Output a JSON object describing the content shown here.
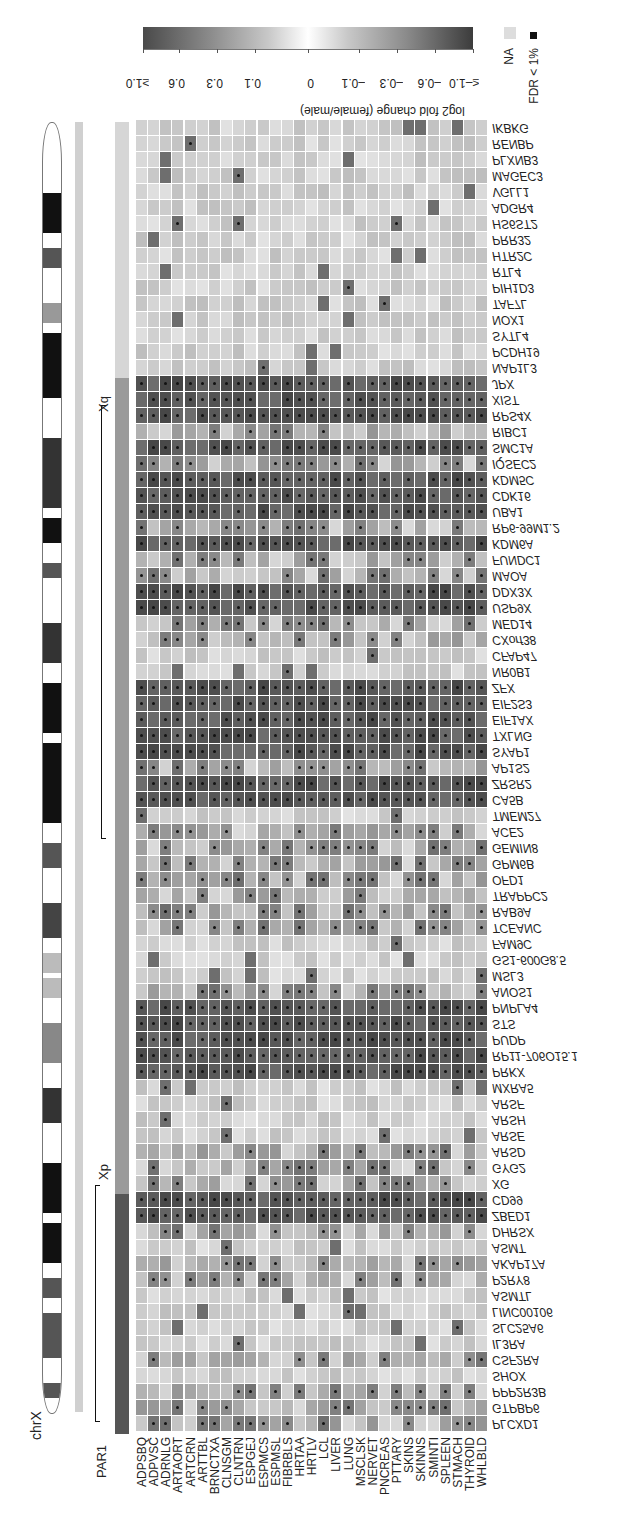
{
  "chart_data": {
    "type": "heatmap",
    "title": "",
    "colorbar": {
      "label": "log2 fold change (female/male)",
      "ticks": [
        "≥1.0",
        "0.6",
        "0.3",
        "0.1",
        "0",
        "–0.1",
        "–0.3",
        "–0.6",
        "≤–1.0"
      ]
    },
    "legend": {
      "na_label": "NA",
      "fdr_label": "FDR < 1%"
    },
    "chromosome_label": "chrX",
    "region_labels": {
      "xq": "Xq",
      "xp": "Xp",
      "par1": "PAR1"
    },
    "columns": [
      "ADPSBQ",
      "ADPVSC",
      "ADRNLG",
      "ARTAORT",
      "ARTCRN",
      "ARTTBL",
      "BRNCTXA",
      "CLNSGM",
      "CLNTRN",
      "ESPGEJ",
      "ESPMCS",
      "ESPMSL",
      "FIBRBLS",
      "HRTAA",
      "HRTLV",
      "LCL",
      "LIVER",
      "LUNG",
      "MSCLSK",
      "NERVET",
      "PNCREAS",
      "PTTARY",
      "SKINS",
      "SKINNS",
      "SMINTI",
      "SPLEEN",
      "STMACH",
      "THYROID",
      "WHLBLD"
    ],
    "rows": [
      "IKBKG",
      "RENBP",
      "PLXNB3",
      "MAGEC3",
      "VGLL1",
      "ADGR4",
      "HS6ST2",
      "PRR32",
      "HTR2C",
      "RTL4",
      "PIH1D3",
      "TAF7L",
      "NOX1",
      "SYTL4",
      "PCDH19",
      "NAP1L3",
      "JPX",
      "XIST",
      "RPS4X",
      "RIBC1",
      "SMC1A",
      "IQSEC2",
      "KDM5C",
      "CDK16",
      "UBA1",
      "RP6-99M1.2",
      "KDM6A",
      "FUNDC1",
      "MAOA",
      "DDX3X",
      "USP9X",
      "MED14",
      "CXorf38",
      "CFAP47",
      "NR0B1",
      "ZFX",
      "EIF2S3",
      "EIF1AX",
      "TXLNG",
      "SYAP1",
      "AP1S2",
      "ZRSR2",
      "CA5B",
      "TMEM27",
      "ACE2",
      "GEMIN8",
      "GPM6B",
      "OFD1",
      "TRAPPC2",
      "RAB9A",
      "TCEANC",
      "FAM9C",
      "GS1-600G8.5",
      "MSL3",
      "ANOS1",
      "PNPLA4",
      "STS",
      "PUDP",
      "RP11-706O15.1",
      "PRKX",
      "MXRA5",
      "ARSF",
      "ARSH",
      "ARSE",
      "ARSD",
      "GYG2",
      "XG",
      "CD99",
      "ZBED1",
      "DHRSX",
      "ASMT",
      "AKAP17A",
      "P2RY8",
      "ASMTL",
      "LINC00106",
      "SLC25A6",
      "IL3RA",
      "CSF2RA",
      "SHOX",
      "PPP2R3B",
      "GTPBP6",
      "PLCXD1"
    ],
    "strong_escape_rows": [
      "JPX",
      "XIST",
      "RPS4X",
      "SMC1A",
      "KDM5C",
      "CDK16",
      "UBA1",
      "KDM6A",
      "DDX3X",
      "USP9X",
      "ZFX",
      "EIF2S3",
      "EIF1AX",
      "TXLNG",
      "SYAP1",
      "ZRSR2",
      "CA5B",
      "PNPLA4",
      "STS",
      "PUDP",
      "RP11-706O15.1",
      "PRKX",
      "CD99",
      "ZBED1"
    ],
    "moderate_rows": [
      "RIBC1",
      "IQSEC2",
      "FUNDC1",
      "MED14",
      "CXorf38",
      "AP1S2",
      "GEMIN8",
      "GPM6B",
      "OFD1",
      "TRAPPC2",
      "RAB9A",
      "TCEANC",
      "ANOS1",
      "ARSD",
      "GYG2",
      "XG",
      "DHRSX",
      "AKAP17A",
      "P2RY8",
      "CSF2RA",
      "PPP2R3B",
      "GTPBP6",
      "PLCXD1",
      "MAOA",
      "RP6-99M1.2",
      "ACE2"
    ],
    "value_range": [
      -1.0,
      1.0
    ]
  }
}
